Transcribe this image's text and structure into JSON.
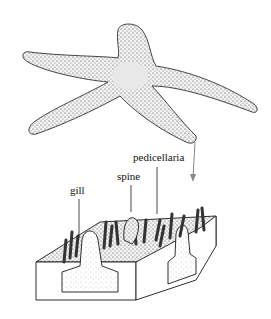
{
  "figure": {
    "labels": {
      "pedicellaria": "pedicellaria",
      "spine": "spine",
      "gill": "gill"
    },
    "colors": {
      "ink": "#1a1a1a",
      "stipple_fill": "#d9d9d9",
      "arrow": "#888888",
      "background": "#ffffff"
    }
  }
}
